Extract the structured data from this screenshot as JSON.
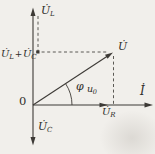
{
  "figure": {
    "kind": "phasor-diagram",
    "background_color": "#f1efeb",
    "line_color": "#3d3a36",
    "text_color": "#2f2d2a",
    "origin_label": "0",
    "axes": {
      "vertical_top_label": {
        "main": "U̇",
        "sub": "L"
      },
      "vertical_bottom_label": {
        "main": "U̇",
        "sub": "C"
      },
      "horizontal_label": {
        "main": "İ",
        "sub": ""
      }
    },
    "vectors": {
      "resultant": {
        "main": "U̇",
        "sub": ""
      },
      "resistor": {
        "main": "U̇",
        "sub": "R"
      },
      "sum_label": {
        "lhs_main": "U̇",
        "lhs_sub": "L",
        "plus": "+",
        "rhs_main": "U̇",
        "rhs_sub": "C"
      }
    },
    "angle": {
      "phi": "φ",
      "u0_main": "u",
      "u0_sub": "0"
    }
  }
}
